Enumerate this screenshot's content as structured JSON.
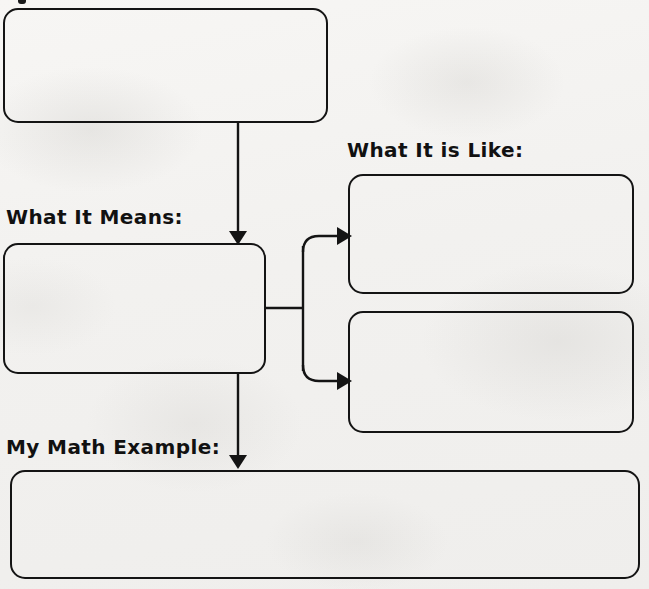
{
  "worksheet": {
    "type": "graphic-organizer",
    "background_color": "#f4f3f1",
    "ink_color": "#141414",
    "title_fragment_visible": "descender of cropped title text at top edge",
    "labels": {
      "what_it_means": "What It Means:",
      "what_it_is_like": "What It is Like:",
      "my_math_example": "My Math Example:"
    },
    "boxes": [
      {
        "id": "term",
        "value": "",
        "placeholder": "",
        "label": ""
      },
      {
        "id": "means",
        "value": "",
        "placeholder": "",
        "label": "What It Means:"
      },
      {
        "id": "like1",
        "value": "",
        "placeholder": "",
        "label": "What It is Like:"
      },
      {
        "id": "like2",
        "value": "",
        "placeholder": "",
        "label": "What It is Like:"
      },
      {
        "id": "example",
        "value": "",
        "placeholder": "",
        "label": "My Math Example:"
      }
    ],
    "connectors": [
      {
        "id": "term-to-means",
        "from": "term",
        "to": "means",
        "direction": "down"
      },
      {
        "id": "means-to-like1",
        "from": "means",
        "to": "like1",
        "direction": "right-up"
      },
      {
        "id": "means-to-like2",
        "from": "means",
        "to": "like2",
        "direction": "right-down"
      },
      {
        "id": "means-to-example",
        "from": "means",
        "to": "example",
        "direction": "down"
      }
    ]
  }
}
